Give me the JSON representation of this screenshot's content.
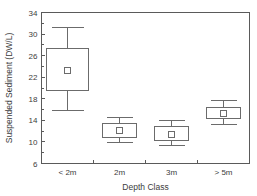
{
  "chart_data": {
    "type": "box",
    "title": "",
    "xlabel": "Depth Class",
    "ylabel": "Suspended Sediment (DW/L)",
    "categories": [
      "< 2m",
      "2m",
      "3m",
      "> 5m"
    ],
    "ylim": [
      6,
      34
    ],
    "yticks": [
      6,
      10,
      14,
      18,
      22,
      26,
      30,
      34
    ],
    "ytick_labels": [
      "6",
      "10",
      "14",
      "18",
      "22",
      "26",
      "30",
      "34"
    ],
    "grid": false,
    "legend": "none",
    "marker_note": "small open square = mean",
    "boxes": [
      {
        "category": "< 2m",
        "whisker_low": 15.8,
        "q1": 19.5,
        "mean": 23.3,
        "q3": 27.3,
        "whisker_high": 31.2
      },
      {
        "category": "2m",
        "whisker_low": 9.9,
        "q1": 10.8,
        "mean": 12.1,
        "q3": 13.4,
        "whisker_high": 14.5
      },
      {
        "category": "3m",
        "whisker_low": 9.3,
        "q1": 10.2,
        "mean": 11.3,
        "q3": 12.8,
        "whisker_high": 13.9
      },
      {
        "category": "> 5m",
        "whisker_low": 13.2,
        "q1": 14.3,
        "mean": 15.2,
        "q3": 16.3,
        "whisker_high": 17.6
      }
    ],
    "colors": {
      "box_stroke": "#6b6b6b",
      "axis": "#5a5a5a",
      "text": "#3d3d3d",
      "background": "#ffffff"
    }
  },
  "axis": {
    "y_ticks": [
      {
        "value": 34,
        "label": "34"
      },
      {
        "value": 30,
        "label": "30"
      },
      {
        "value": 26,
        "label": "26"
      },
      {
        "value": 22,
        "label": "22"
      },
      {
        "value": 18,
        "label": "18"
      },
      {
        "value": 14,
        "label": "14"
      },
      {
        "value": 10,
        "label": "10"
      },
      {
        "value": 6,
        "label": "6"
      }
    ],
    "x_ticks": [
      {
        "label": "< 2m"
      },
      {
        "label": "2m"
      },
      {
        "label": "3m"
      },
      {
        "label": "> 5m"
      }
    ],
    "x_title": "Depth Class",
    "y_title": "Suspended Sediment (DW/L)"
  }
}
